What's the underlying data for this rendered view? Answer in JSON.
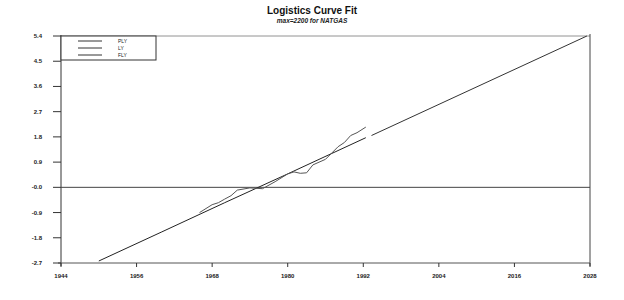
{
  "chart_data": {
    "type": "line",
    "title": "Logistics Curve Fit",
    "subtitle": "max=2200 for NATGAS",
    "xlabel": "",
    "ylabel": "",
    "xlim": [
      1944,
      2028
    ],
    "ylim": [
      -2.7,
      5.4
    ],
    "x_ticks": [
      "1944",
      "1956",
      "1968",
      "1980",
      "1992",
      "2004",
      "2016",
      "2028"
    ],
    "y_ticks": [
      "5.4",
      "4.5",
      "3.6",
      "2.7",
      "1.8",
      "0.9",
      "-0.0",
      "-0.9",
      "-1.8",
      "-2.7"
    ],
    "grid": false,
    "legend_position": "top-left",
    "reference_line": {
      "y": 0.0
    },
    "series": [
      {
        "name": "PLY",
        "x": [
          1950,
          1960,
          1970,
          1980,
          1992.4
        ],
        "values": [
          -2.63,
          -1.59,
          -0.55,
          0.48,
          1.77
        ]
      },
      {
        "name": "LY",
        "x": [
          1966,
          1968,
          1969,
          1970,
          1971,
          1972,
          1974,
          1976,
          1978,
          1980,
          1981,
          1982,
          1983,
          1984,
          1986,
          1988,
          1989,
          1990,
          1991,
          1992.4
        ],
        "values": [
          -0.9,
          -0.62,
          -0.55,
          -0.42,
          -0.3,
          -0.1,
          -0.02,
          -0.05,
          0.2,
          0.48,
          0.55,
          0.5,
          0.52,
          0.8,
          1.0,
          1.45,
          1.6,
          1.85,
          1.95,
          2.15
        ]
      },
      {
        "name": "FLY",
        "x": [
          1993.3,
          2027.5
        ],
        "values": [
          1.85,
          5.4
        ]
      }
    ]
  },
  "legend": {
    "items": [
      "PLY",
      "LY",
      "FLY"
    ]
  }
}
